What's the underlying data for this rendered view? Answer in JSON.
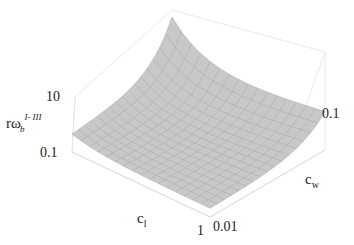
{
  "chart_data": {
    "type": "surface3d",
    "title": "",
    "z_axis": {
      "label_base": "rω",
      "label_sub": "b",
      "label_sup": "I- III",
      "scale": "log",
      "ticks": [
        "10",
        "0.1"
      ]
    },
    "x_axis": {
      "label_base": "c",
      "label_sub": "l",
      "scale": "log",
      "ticks": [
        "1"
      ]
    },
    "y_axis": {
      "label_base": "c",
      "label_sub": "w",
      "scale": "log",
      "ticks": [
        "0.01",
        "0.1"
      ]
    },
    "surface": {
      "color": "#c8c8c8",
      "mesh_color": "#a8a8a8",
      "grid_lines": 16,
      "description": "Surface high (~10+) at small c_l and small c_w corner, decreasing toward ~0.1 as c_l and c_w increase; concave-up valley shape"
    },
    "box": {
      "visible": true,
      "color": "#dcdcdc"
    }
  }
}
